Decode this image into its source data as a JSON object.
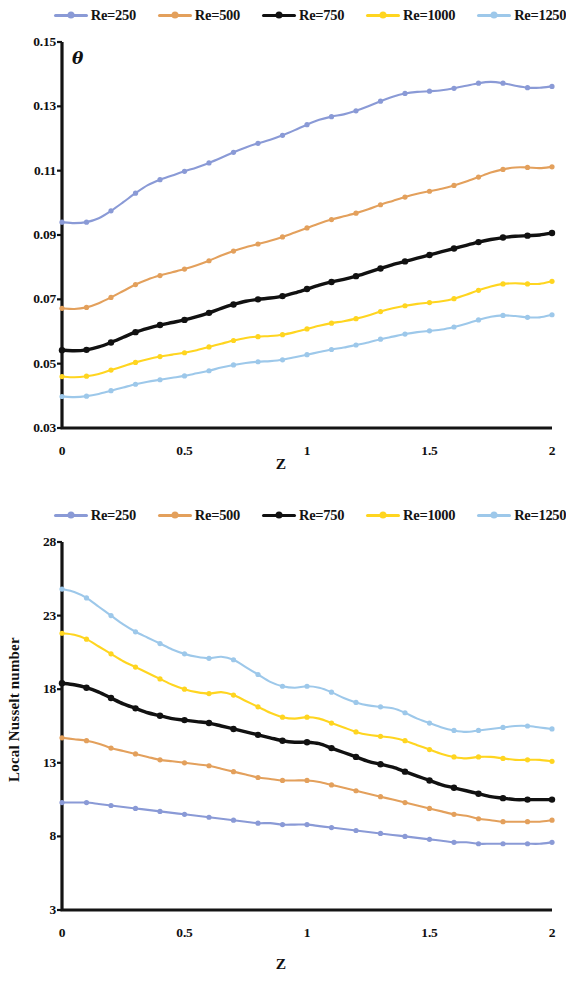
{
  "figure": {
    "panels": [
      {
        "id": "theta-panel",
        "legend": [
          {
            "label": "Re=250",
            "color": "#8a9ad6"
          },
          {
            "label": "Re=500",
            "color": "#e3a05c"
          },
          {
            "label": "Re=750",
            "color": "#111111"
          },
          {
            "label": "Re=1000",
            "color": "#ffd520"
          },
          {
            "label": "Re=1250",
            "color": "#9dc8ea"
          }
        ],
        "chart_data": {
          "type": "line",
          "title": "",
          "xlabel": "Z",
          "ylabel": "θ",
          "xlim": [
            0,
            2
          ],
          "ylim": [
            0.03,
            0.15
          ],
          "xticks": [
            "0",
            "0.5",
            "1",
            "1.5",
            "2"
          ],
          "xtick_values": [
            0,
            0.5,
            1,
            1.5,
            2
          ],
          "yticks": [
            "0.03",
            "0.05",
            "0.07",
            "0.09",
            "0.11",
            "0.13",
            "0.15"
          ],
          "ytick_values": [
            0.03,
            0.05,
            0.07,
            0.09,
            0.11,
            0.13,
            0.15
          ],
          "grid": false,
          "legend_position": "top",
          "markers": true,
          "x": [
            0,
            0.05,
            0.1,
            0.15,
            0.2,
            0.25,
            0.3,
            0.35,
            0.4,
            0.45,
            0.5,
            0.55,
            0.6,
            0.65,
            0.7,
            0.75,
            0.8,
            0.85,
            0.9,
            0.95,
            1.0,
            1.05,
            1.1,
            1.15,
            1.2,
            1.25,
            1.3,
            1.35,
            1.4,
            1.45,
            1.5,
            1.55,
            1.6,
            1.65,
            1.7,
            1.75,
            1.8,
            1.85,
            1.9,
            1.95,
            2.0
          ],
          "series": [
            {
              "name": "Re=250",
              "color": "#8a9ad6",
              "values": [
                0.094,
                0.0937,
                0.094,
                0.0952,
                0.0975,
                0.1002,
                0.103,
                0.1055,
                0.1072,
                0.1085,
                0.1098,
                0.111,
                0.1124,
                0.114,
                0.1157,
                0.1172,
                0.1185,
                0.1196,
                0.121,
                0.1226,
                0.1243,
                0.1258,
                0.1268,
                0.1275,
                0.1286,
                0.13,
                0.1316,
                0.133,
                0.134,
                0.1345,
                0.1347,
                0.135,
                0.1356,
                0.1364,
                0.1372,
                0.1376,
                0.1372,
                0.1364,
                0.1358,
                0.1358,
                0.1362
              ]
            },
            {
              "name": "Re=500",
              "color": "#e3a05c",
              "values": [
                0.0672,
                0.067,
                0.0675,
                0.0688,
                0.0706,
                0.0726,
                0.0746,
                0.0762,
                0.0774,
                0.0784,
                0.0794,
                0.0806,
                0.082,
                0.0836,
                0.085,
                0.0862,
                0.0872,
                0.0882,
                0.0894,
                0.0908,
                0.0922,
                0.0936,
                0.0948,
                0.0958,
                0.0968,
                0.098,
                0.0994,
                0.1006,
                0.1018,
                0.1028,
                0.1036,
                0.1044,
                0.1054,
                0.1066,
                0.108,
                0.1094,
                0.1104,
                0.111,
                0.111,
                0.1108,
                0.1112
              ]
            },
            {
              "name": "Re=750",
              "color": "#111111",
              "values": [
                0.0542,
                0.054,
                0.0543,
                0.0552,
                0.0566,
                0.0582,
                0.0598,
                0.061,
                0.062,
                0.0628,
                0.0636,
                0.0646,
                0.0658,
                0.0672,
                0.0684,
                0.0694,
                0.07,
                0.0704,
                0.071,
                0.072,
                0.0732,
                0.0744,
                0.0754,
                0.0762,
                0.0772,
                0.0784,
                0.0796,
                0.0808,
                0.0818,
                0.0828,
                0.0838,
                0.0848,
                0.0858,
                0.0868,
                0.0878,
                0.0886,
                0.0892,
                0.0896,
                0.0898,
                0.09,
                0.0906
              ]
            },
            {
              "name": "Re=1000",
              "color": "#ffd520",
              "values": [
                0.046,
                0.0458,
                0.0461,
                0.0468,
                0.048,
                0.0492,
                0.0504,
                0.0514,
                0.0522,
                0.0528,
                0.0534,
                0.0542,
                0.0552,
                0.0562,
                0.0572,
                0.058,
                0.0584,
                0.0586,
                0.059,
                0.0598,
                0.0608,
                0.0618,
                0.0626,
                0.0632,
                0.064,
                0.065,
                0.0662,
                0.0672,
                0.068,
                0.0686,
                0.069,
                0.0694,
                0.0702,
                0.0714,
                0.0728,
                0.074,
                0.0748,
                0.075,
                0.0748,
                0.0748,
                0.0756
              ]
            },
            {
              "name": "Re=1250",
              "color": "#9dc8ea",
              "values": [
                0.0398,
                0.0396,
                0.0399,
                0.0406,
                0.0416,
                0.0426,
                0.0436,
                0.0444,
                0.045,
                0.0456,
                0.0462,
                0.047,
                0.0478,
                0.0488,
                0.0496,
                0.0502,
                0.0506,
                0.0508,
                0.0512,
                0.052,
                0.0528,
                0.0536,
                0.0544,
                0.055,
                0.0558,
                0.0566,
                0.0576,
                0.0584,
                0.0592,
                0.0598,
                0.0602,
                0.0606,
                0.0614,
                0.0624,
                0.0636,
                0.0646,
                0.065,
                0.0648,
                0.0644,
                0.0644,
                0.0652
              ]
            }
          ]
        }
      },
      {
        "id": "nusselt-panel",
        "legend": [
          {
            "label": "Re=250",
            "color": "#8a9ad6"
          },
          {
            "label": "Re=500",
            "color": "#e3a05c"
          },
          {
            "label": "Re=750",
            "color": "#111111"
          },
          {
            "label": "Re=1000",
            "color": "#ffd520"
          },
          {
            "label": "Re=1250",
            "color": "#9dc8ea"
          }
        ],
        "chart_data": {
          "type": "line",
          "title": "",
          "xlabel": "Z",
          "ylabel": "Local Nusselt number",
          "xlim": [
            0,
            2
          ],
          "ylim": [
            3,
            28
          ],
          "xticks": [
            "0",
            "0.5",
            "1",
            "1.5",
            "2"
          ],
          "xtick_values": [
            0,
            0.5,
            1,
            1.5,
            2
          ],
          "yticks": [
            "3",
            "8",
            "13",
            "18",
            "23",
            "28"
          ],
          "ytick_values": [
            3,
            8,
            13,
            18,
            23,
            28
          ],
          "grid": false,
          "legend_position": "top",
          "markers": true,
          "x": [
            0,
            0.05,
            0.1,
            0.15,
            0.2,
            0.25,
            0.3,
            0.35,
            0.4,
            0.45,
            0.5,
            0.55,
            0.6,
            0.65,
            0.7,
            0.75,
            0.8,
            0.85,
            0.9,
            0.95,
            1.0,
            1.05,
            1.1,
            1.15,
            1.2,
            1.25,
            1.3,
            1.35,
            1.4,
            1.45,
            1.5,
            1.55,
            1.6,
            1.65,
            1.7,
            1.75,
            1.8,
            1.85,
            1.9,
            1.95,
            2.0
          ],
          "series": [
            {
              "name": "Re=1250",
              "color": "#9dc8ea",
              "values": [
                24.8,
                24.6,
                24.2,
                23.6,
                23.0,
                22.4,
                21.9,
                21.5,
                21.1,
                20.7,
                20.4,
                20.2,
                20.1,
                20.2,
                20.0,
                19.5,
                19.0,
                18.5,
                18.2,
                18.1,
                18.2,
                18.1,
                17.8,
                17.4,
                17.1,
                16.9,
                16.8,
                16.7,
                16.4,
                16.0,
                15.7,
                15.4,
                15.2,
                15.1,
                15.2,
                15.3,
                15.4,
                15.5,
                15.5,
                15.4,
                15.3
              ]
            },
            {
              "name": "Re=1000",
              "color": "#ffd520",
              "values": [
                21.8,
                21.7,
                21.4,
                20.9,
                20.4,
                19.9,
                19.5,
                19.1,
                18.7,
                18.3,
                18.0,
                17.8,
                17.7,
                17.8,
                17.6,
                17.2,
                16.8,
                16.4,
                16.1,
                16.0,
                16.1,
                16.0,
                15.7,
                15.4,
                15.1,
                14.9,
                14.8,
                14.7,
                14.5,
                14.2,
                13.9,
                13.6,
                13.4,
                13.3,
                13.4,
                13.4,
                13.3,
                13.2,
                13.2,
                13.2,
                13.1
              ]
            },
            {
              "name": "Re=750",
              "color": "#111111",
              "values": [
                18.4,
                18.3,
                18.1,
                17.8,
                17.4,
                17.0,
                16.7,
                16.4,
                16.2,
                16.0,
                15.9,
                15.8,
                15.7,
                15.5,
                15.3,
                15.1,
                14.9,
                14.7,
                14.5,
                14.4,
                14.4,
                14.3,
                14.0,
                13.7,
                13.4,
                13.1,
                12.9,
                12.7,
                12.4,
                12.1,
                11.8,
                11.5,
                11.3,
                11.1,
                10.9,
                10.7,
                10.6,
                10.5,
                10.5,
                10.5,
                10.5
              ]
            },
            {
              "name": "Re=500",
              "color": "#e3a05c",
              "values": [
                14.7,
                14.6,
                14.5,
                14.3,
                14.0,
                13.8,
                13.6,
                13.4,
                13.2,
                13.1,
                13.0,
                12.9,
                12.8,
                12.6,
                12.4,
                12.2,
                12.0,
                11.9,
                11.8,
                11.8,
                11.8,
                11.7,
                11.5,
                11.3,
                11.1,
                10.9,
                10.7,
                10.5,
                10.3,
                10.1,
                9.9,
                9.7,
                9.5,
                9.4,
                9.2,
                9.1,
                9.0,
                9.0,
                9.0,
                9.0,
                9.1
              ]
            },
            {
              "name": "Re=250",
              "color": "#8a9ad6",
              "values": [
                10.3,
                10.3,
                10.3,
                10.2,
                10.1,
                10.0,
                9.9,
                9.8,
                9.7,
                9.6,
                9.5,
                9.4,
                9.3,
                9.2,
                9.1,
                9.0,
                8.9,
                8.9,
                8.8,
                8.8,
                8.8,
                8.7,
                8.6,
                8.5,
                8.4,
                8.3,
                8.2,
                8.1,
                8.0,
                7.9,
                7.8,
                7.7,
                7.6,
                7.6,
                7.5,
                7.5,
                7.5,
                7.5,
                7.5,
                7.5,
                7.6
              ]
            }
          ]
        }
      }
    ]
  }
}
